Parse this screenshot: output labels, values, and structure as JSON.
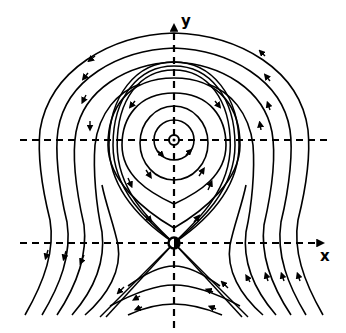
{
  "diagram": {
    "type": "phase-portrait",
    "axes": {
      "x_label": "x",
      "y_label": "y"
    },
    "fixed_points": [
      {
        "kind": "center",
        "x": 174,
        "y": 140
      },
      {
        "kind": "saddle",
        "x": 174,
        "y": 243
      }
    ],
    "flow_direction": "counter-clockwise around center",
    "colors": {
      "line": "#000000",
      "background": "#ffffff"
    }
  }
}
